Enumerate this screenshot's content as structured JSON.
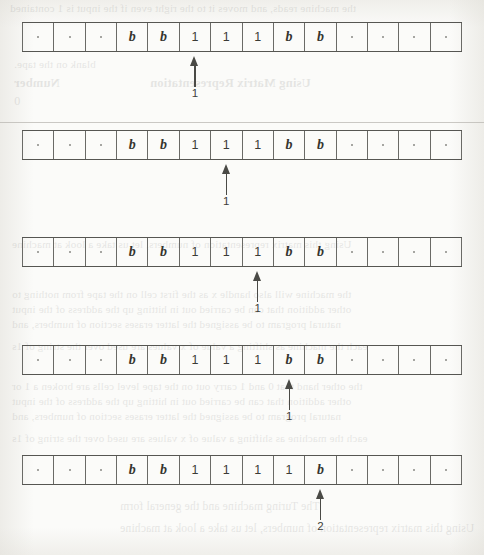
{
  "figure": {
    "type": "turing-machine-tape-trace",
    "cell_count": 14,
    "symbols": {
      "blank_marker": "·",
      "b": "b",
      "one": "1"
    },
    "frames": [
      {
        "id": "frame-1",
        "cells": [
          "·",
          "·",
          "·",
          "b",
          "b",
          "1",
          "1",
          "1",
          "b",
          "b",
          "·",
          "·",
          "·",
          "·"
        ],
        "head_cell_index": 5,
        "head_state": "1"
      },
      {
        "id": "frame-2",
        "cells": [
          "·",
          "·",
          "·",
          "b",
          "b",
          "1",
          "1",
          "1",
          "b",
          "b",
          "·",
          "·",
          "·",
          "·"
        ],
        "head_cell_index": 6,
        "head_state": "1"
      },
      {
        "id": "frame-3",
        "cells": [
          "·",
          "·",
          "·",
          "b",
          "b",
          "1",
          "1",
          "1",
          "b",
          "b",
          "·",
          "·",
          "·",
          "·"
        ],
        "head_cell_index": 7,
        "head_state": "1"
      },
      {
        "id": "frame-4",
        "cells": [
          "·",
          "·",
          "·",
          "b",
          "b",
          "1",
          "1",
          "1",
          "b",
          "b",
          "·",
          "·",
          "·",
          "·"
        ],
        "head_cell_index": 8,
        "head_state": "1"
      },
      {
        "id": "frame-5",
        "cells": [
          "·",
          "·",
          "·",
          "b",
          "b",
          "1",
          "1",
          "1",
          "1",
          "b",
          "·",
          "·",
          "·",
          "·"
        ],
        "head_cell_index": 9,
        "head_state": "2"
      }
    ]
  },
  "background_text": {
    "bleed_through": [
      "Number",
      "Using Matrix Representation",
      "0",
      "the machine reads, and moves it to the right even if the input is 1 contained",
      "blank on the tape.",
      "Using this matrix representation of numbers, let us take a look at machine",
      "the machine will also handle x as the first cell on the tape from nothing to",
      "other addition that can be carried out in hitting up the address of the input",
      "natural program to be assigned the latter erases section of numbers, and",
      "each the machine as shifting a value of x values are used over the string of 1s",
      "the other hand that 0 and 1 carry out on the tape level cells are broken a 1 or",
      "The Turing machine and the general form"
    ]
  }
}
